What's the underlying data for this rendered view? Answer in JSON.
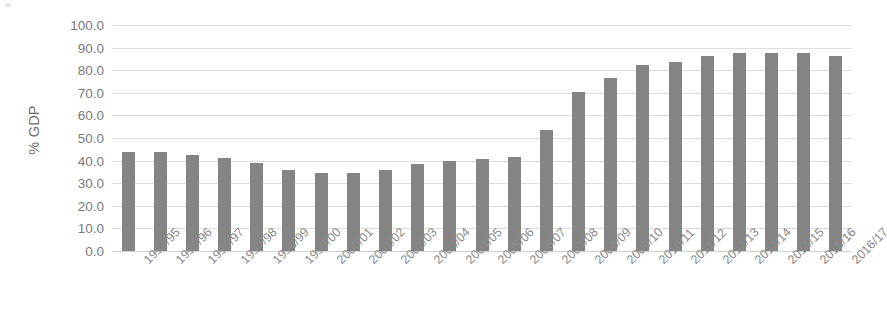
{
  "chart_data": {
    "type": "bar",
    "title": "",
    "xlabel": "",
    "ylabel": "% GDP",
    "ylim": [
      0,
      100
    ],
    "ytick_step": 10,
    "ytick_labels": [
      "100.0",
      "90.0",
      "80.0",
      "70.0",
      "60.0",
      "50.0",
      "40.0",
      "30.0",
      "20.0",
      "10.0",
      "0.0"
    ],
    "grid": true,
    "legend": "none",
    "bar_color": "#848484",
    "gridline_color": "#dddddd",
    "categories": [
      "1994/95",
      "1995/96",
      "1996/97",
      "1997/98",
      "1998/99",
      "1999/00",
      "2000/01",
      "2001/02",
      "2002/03",
      "2003/04",
      "2004/05",
      "2005/06",
      "2006/07",
      "2007/08",
      "2008/09",
      "2009/10",
      "2010/11",
      "2011/12",
      "2012/13",
      "2013/14",
      "2014/15",
      "2015/16",
      "2016/17"
    ],
    "values": [
      44.0,
      44.0,
      42.5,
      41.0,
      39.0,
      36.0,
      34.5,
      34.5,
      36.0,
      38.5,
      40.0,
      40.5,
      41.5,
      53.5,
      70.5,
      76.5,
      82.5,
      83.5,
      86.5,
      87.5,
      87.5,
      87.5,
      86.5
    ]
  }
}
